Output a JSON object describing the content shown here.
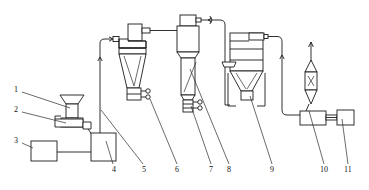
{
  "diagram": {
    "type": "process-flow-diagram",
    "width": 369,
    "height": 190,
    "background_color": "#ffffff",
    "line_color": "#1a1a1a",
    "text_color": "#111111",
    "callouts": [
      {
        "id": "1",
        "label": "1",
        "x": 15,
        "y": 89,
        "anchor_x": 70,
        "anchor_y": 108
      },
      {
        "id": "2",
        "label": "2",
        "x": 15,
        "y": 109,
        "anchor_x": 67,
        "anchor_y": 122
      },
      {
        "id": "3",
        "label": "3",
        "x": 15,
        "y": 140,
        "anchor_x": 33,
        "anchor_y": 149
      },
      {
        "id": "4",
        "label": "4",
        "x": 112,
        "y": 168,
        "anchor_x": 104,
        "anchor_y": 140
      },
      {
        "id": "5",
        "label": "5",
        "x": 142,
        "y": 168,
        "anchor_x": 100,
        "anchor_y": 110
      },
      {
        "id": "6",
        "label": "6",
        "x": 175,
        "y": 168,
        "anchor_x": 148,
        "anchor_y": 98
      },
      {
        "id": "7",
        "label": "7",
        "x": 209,
        "y": 168,
        "anchor_x": 190,
        "anchor_y": 104
      },
      {
        "id": "8",
        "label": "8",
        "x": 227,
        "y": 168,
        "anchor_x": 189,
        "anchor_y": 70
      },
      {
        "id": "9",
        "label": "9",
        "x": 270,
        "y": 168,
        "anchor_x": 250,
        "anchor_y": 96
      },
      {
        "id": "10",
        "label": "10",
        "x": 321,
        "y": 168,
        "anchor_x": 308,
        "anchor_y": 112
      },
      {
        "id": "11",
        "label": "11",
        "x": 345,
        "y": 168,
        "anchor_x": 340,
        "anchor_y": 118
      }
    ],
    "equipment": [
      {
        "id": "1",
        "name": "feed-hopper",
        "description": "Feed hopper"
      },
      {
        "id": "2",
        "name": "vibratory-feeder",
        "description": "Vibratory feeder"
      },
      {
        "id": "3",
        "name": "control-cabinet",
        "description": "Control cabinet"
      },
      {
        "id": "4",
        "name": "mill",
        "description": "Mill / grinder"
      },
      {
        "id": "5",
        "name": "riser-duct",
        "description": "Riser duct"
      },
      {
        "id": "6",
        "name": "cyclone-rotary-valve",
        "description": "Cyclone discharge rotary valve"
      },
      {
        "id": "7",
        "name": "classifier-outlet",
        "description": "Classifier outlet valve"
      },
      {
        "id": "8",
        "name": "classifier-column",
        "description": "Classifier column"
      },
      {
        "id": "9",
        "name": "baghouse-filter",
        "description": "Baghouse dust filter"
      },
      {
        "id": "10",
        "name": "venturi-fan",
        "description": "Venturi / induced draft fan"
      },
      {
        "id": "11",
        "name": "drive-motor",
        "description": "Drive motor"
      }
    ]
  }
}
